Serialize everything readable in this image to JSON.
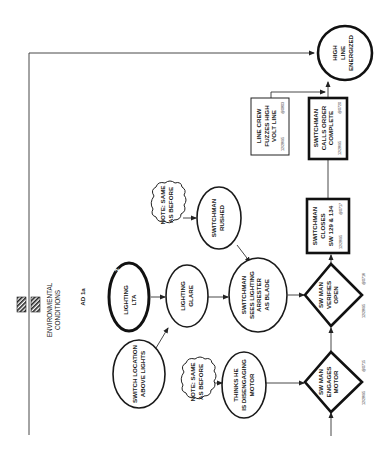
{
  "diagram": {
    "type": "event-and-causal-factors-chart",
    "orientation": "rotated-90-ccw",
    "legend": {
      "label_line1": "ENVIRONMENTAL",
      "label_line2": "CONDITIONS"
    },
    "events": [
      {
        "id": "engages",
        "shape": "diamond",
        "lines": [
          "SW MAN",
          "ENGAGES",
          "MOTOR"
        ],
        "date": "12/28/95",
        "time": "@0715"
      },
      {
        "id": "verifies",
        "shape": "diamond",
        "lines": [
          "SW MAN",
          "VERIFIES",
          "OPEN"
        ],
        "date": "12/28/95",
        "time": "@0716"
      },
      {
        "id": "closes",
        "shape": "box-thick",
        "lines": [
          "SWITCHMAN",
          "CLOSES",
          "SW 129 & 134"
        ],
        "date": "12/28/95",
        "time": "@0717"
      },
      {
        "id": "calls",
        "shape": "box-thick",
        "lines": [
          "SWITCHMAN",
          "CALLS ORDER",
          "COMPLETE"
        ],
        "date": "12/28/95",
        "time": "@0720"
      },
      {
        "id": "linecrew",
        "shape": "box-thin",
        "lines": [
          "LINE CREW",
          "FUZZES HIGH",
          "VOLT LINE"
        ],
        "date": "12/28/95",
        "time": "@0803"
      },
      {
        "id": "outcome",
        "shape": "circle",
        "lines": [
          "HIGH",
          "LINE",
          "ENERGIZED"
        ]
      }
    ],
    "conditions": [
      {
        "id": "sees",
        "lines": [
          "SWITCHMAN",
          "SEES LIGHTING",
          "ARRESTER",
          "AS BLADE"
        ]
      },
      {
        "id": "rushed",
        "lines": [
          "SWITCHMAN",
          "RUSHED"
        ]
      },
      {
        "id": "glare",
        "lines": [
          "LIGHTING",
          "GLARE"
        ]
      },
      {
        "id": "lta",
        "tag": "AD 1a",
        "badge": "2",
        "lines": [
          "LIGHTING",
          "LTA"
        ]
      },
      {
        "id": "location",
        "lines": [
          "SWITCH LOCATION",
          "ABOVE LIGHTS"
        ]
      },
      {
        "id": "thinks",
        "lines": [
          "THINKS HE",
          "IS DISENGAGING",
          "MOTOR"
        ]
      }
    ],
    "notes": [
      {
        "id": "note_top",
        "lines": [
          "NOTE: SAME",
          "AS BEFORE"
        ]
      },
      {
        "id": "note_bottom",
        "lines": [
          "NOTE: SAME",
          "AS BEFORE"
        ]
      }
    ]
  }
}
